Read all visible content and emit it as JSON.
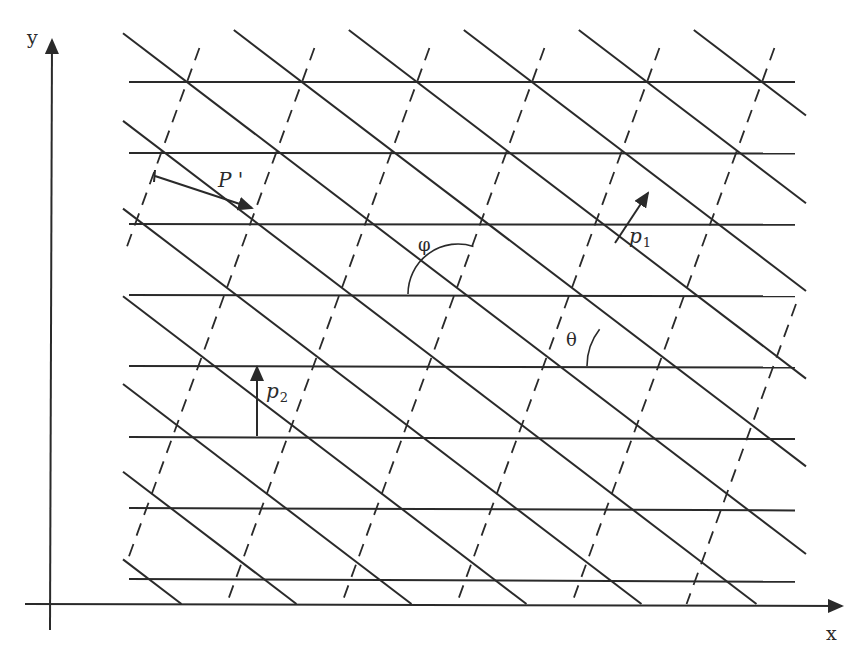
{
  "diagram": {
    "title": "",
    "stroke_color": "#2a2a2a",
    "background": "#ffffff",
    "axes": {
      "x_label": "x",
      "y_label": "y",
      "origin": [
        50,
        604
      ],
      "x_axis_end": [
        842,
        606
      ],
      "y_axis_top": [
        52,
        40
      ],
      "x_axis_start": [
        25,
        604
      ],
      "y_axis_bottom": [
        50,
        630
      ]
    },
    "lattice": {
      "x0": 187,
      "y0": 82,
      "col_spacing": 115,
      "row_spacing": 71,
      "row_shift": 25.9,
      "rows": 8,
      "horizontal_x_range": [
        129,
        795
      ],
      "clip_box": {
        "left": 123,
        "right": 806,
        "top": 30,
        "bottom": 604
      }
    },
    "labels": {
      "P_prime": "P '",
      "p1": "p",
      "p1_sub": "1",
      "p2": "p",
      "p2_sub": "2",
      "phi": "φ",
      "theta": "θ"
    },
    "vectors": {
      "P_prime": {
        "from": [
          155,
          176
        ],
        "to": [
          252,
          208
        ]
      },
      "p1": {
        "from": [
          615,
          243
        ],
        "to": [
          648,
          193
        ]
      },
      "p2": {
        "from": [
          257,
          436
        ],
        "to": [
          257,
          367
        ]
      }
    },
    "angles": {
      "phi": {
        "center": [
          458,
          294
        ],
        "radius": 50
      },
      "theta": {
        "center": [
          647,
          366
        ],
        "radius": 60
      }
    }
  }
}
